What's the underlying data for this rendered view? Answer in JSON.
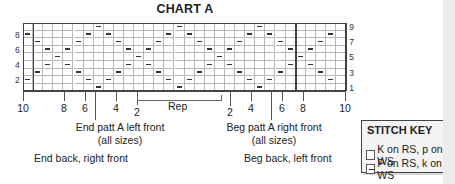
{
  "chart": {
    "title": "CHART A",
    "rows": 9,
    "cols": 32,
    "cell_width": 10.1,
    "cell_height": 7.6,
    "row_labels_left": [
      {
        "row": 2,
        "label": "2"
      },
      {
        "row": 4,
        "label": "4"
      },
      {
        "row": 6,
        "label": "6"
      },
      {
        "row": 8,
        "label": "8"
      }
    ],
    "row_labels_right": [
      {
        "row": 1,
        "label": "1"
      },
      {
        "row": 3,
        "label": "3"
      },
      {
        "row": 5,
        "label": "5"
      },
      {
        "row": 7,
        "label": "7"
      },
      {
        "row": 9,
        "label": "9"
      }
    ],
    "purl_cells": {
      "9": [
        7,
        15,
        23
      ],
      "8": [
        0,
        6,
        8,
        14,
        16,
        22,
        24,
        30
      ],
      "7": [
        1,
        5,
        9,
        13,
        17,
        21,
        25,
        29
      ],
      "6": [
        2,
        4,
        10,
        12,
        18,
        20,
        26,
        28
      ],
      "5": [
        3,
        11,
        19,
        27
      ],
      "4": [
        2,
        4,
        10,
        12,
        18,
        20,
        26,
        28
      ],
      "3": [
        1,
        5,
        9,
        13,
        17,
        21,
        25,
        29
      ],
      "2": [
        0,
        6,
        8,
        14,
        16,
        22,
        24,
        30
      ],
      "1": [
        7,
        15,
        23
      ]
    },
    "thick_col_lines": [
      1,
      27
    ],
    "column_labels": [
      {
        "label": "10",
        "x": 23
      },
      {
        "label": "8",
        "x": 64
      },
      {
        "label": "6",
        "x": 85
      },
      {
        "label": "4",
        "x": 116
      },
      {
        "label": "2",
        "x": 137,
        "low": true
      },
      {
        "label": "2",
        "x": 230,
        "low": true
      },
      {
        "label": "4",
        "x": 251
      },
      {
        "label": "6",
        "x": 282
      },
      {
        "label": "8",
        "x": 303
      },
      {
        "label": "10",
        "x": 345
      }
    ],
    "rep_label": "Rep"
  },
  "annotations": {
    "end_left_front_line1": "End patt A left front",
    "end_left_front_line2": "(all sizes)",
    "end_back_right_front": "End back, right front",
    "beg_right_front_line1": "Beg patt A right front",
    "beg_right_front_line2": "(all sizes)",
    "beg_back_left_front": "Beg back, left front"
  },
  "stitch_key": {
    "title": "STITCH KEY",
    "items": [
      {
        "symbol": "blank",
        "label": "K on RS, p on WS"
      },
      {
        "symbol": "dash",
        "label": "P on RS, k on WS"
      }
    ]
  }
}
